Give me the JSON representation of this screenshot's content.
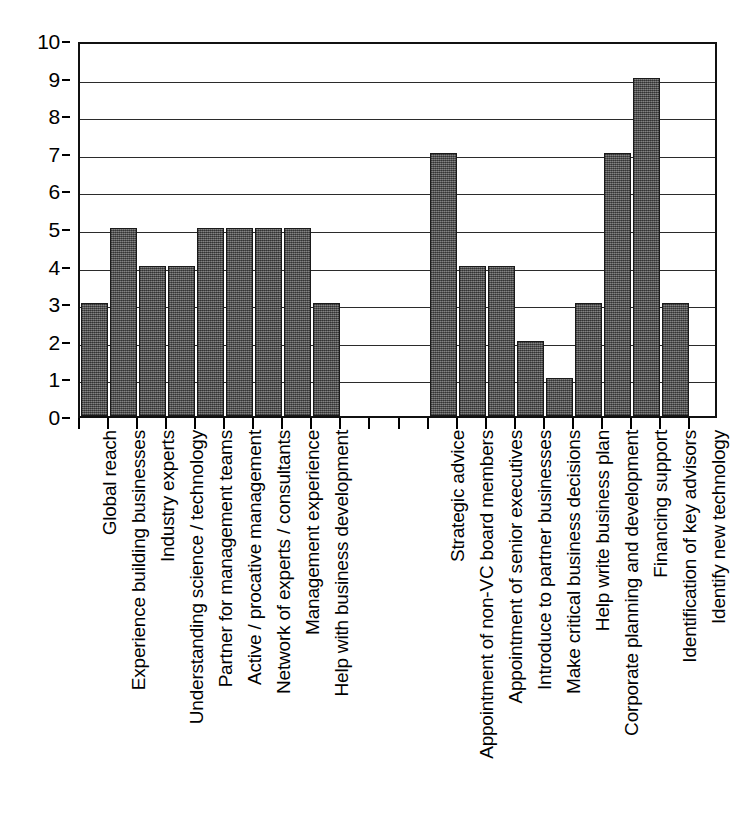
{
  "chart_data": {
    "type": "bar",
    "title": "",
    "subtitle": "",
    "xlabel": "",
    "ylabel": "",
    "ylim": [
      0,
      10
    ],
    "yticks": [
      0,
      1,
      2,
      3,
      4,
      5,
      6,
      7,
      8,
      9,
      10
    ],
    "ytick_labels": [
      "0",
      "1",
      "2",
      "3",
      "4",
      "5",
      "6",
      "7",
      "8",
      "9",
      "10"
    ],
    "grid": true,
    "legend": "none",
    "orientation": "vertical",
    "bar_color": "#5e5e5e",
    "bar_edge_color": "#1a1a1a",
    "axis_color": "#111111",
    "gridline_color": "#2b2b2b",
    "background_color": "#ffffff",
    "group_gap_slots": 3,
    "categories": [
      "Global reach",
      "Experience building businesses",
      "Industry experts",
      "Understanding science / technology",
      "Partner for management teams",
      "Active / procative management",
      "Network of experts / consultants",
      "Management experience",
      "Help with business development",
      "Strategic advice",
      "Appointment of non-VC board members",
      "Appointment of senior executives",
      "Introduce to partner businesses",
      "Make critical business decisions",
      "Help write business plan",
      "Corporate planning and development",
      "Financing support",
      "Identification of key advisors",
      "Identify new technology"
    ],
    "values": [
      3,
      5,
      4,
      4,
      5,
      5,
      5,
      5,
      3,
      7,
      4,
      4,
      2,
      1,
      3,
      7,
      9,
      3,
      0
    ],
    "groups": [
      {
        "name": "group-1",
        "categories": [
          "Global reach",
          "Experience building businesses",
          "Industry experts",
          "Understanding science / technology",
          "Partner for management teams",
          "Active / procative management",
          "Network of experts / consultants",
          "Management experience",
          "Help with business development"
        ],
        "values": [
          3,
          5,
          4,
          4,
          5,
          5,
          5,
          5,
          3
        ]
      },
      {
        "name": "group-2",
        "categories": [
          "Strategic advice",
          "Appointment of non-VC board members",
          "Appointment of senior executives",
          "Introduce to partner businesses",
          "Make critical business decisions",
          "Help write business plan",
          "Corporate planning and development",
          "Financing support",
          "Identification of key advisors",
          "Identify new technology"
        ],
        "values": [
          7,
          4,
          4,
          2,
          1,
          3,
          7,
          9,
          3,
          0
        ]
      }
    ]
  }
}
